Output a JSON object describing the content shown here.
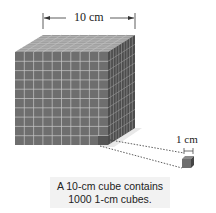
{
  "diagram": {
    "big_cube_label": "10 cm",
    "small_cube_label": "1 cm",
    "caption_line1": "A 10-cm cube contains",
    "caption_line2": "1000 1-cm cubes.",
    "grid_divisions": 10,
    "colors": {
      "front_face": "#6e6e6e",
      "top_face": "#9a9a9a",
      "right_face": "#4a4a4a",
      "grid_line": "#c8c8c8",
      "shadow": "#e6e6e6"
    }
  }
}
